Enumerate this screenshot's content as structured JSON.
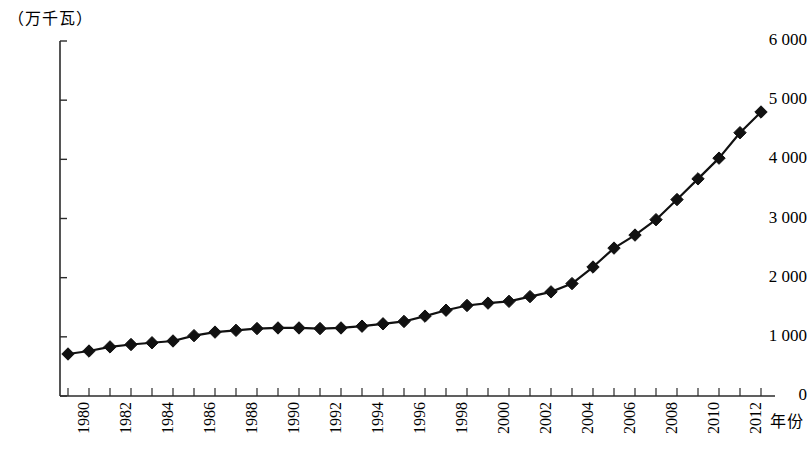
{
  "chart_data": {
    "type": "line",
    "title": "",
    "ylabel": "（万千瓦）",
    "xlabel": "年份",
    "ylim": [
      0,
      6000
    ],
    "ytick_labels": [
      "0",
      "1 000",
      "2 000",
      "3 000",
      "4 000",
      "5 000",
      "6 000"
    ],
    "ytick_values": [
      0,
      1000,
      2000,
      3000,
      4000,
      5000,
      6000
    ],
    "grid": false,
    "legend": "none",
    "marker": "diamond",
    "line_color": "#111111",
    "marker_color": "#111111",
    "x": [
      1980,
      1981,
      1982,
      1983,
      1984,
      1985,
      1986,
      1987,
      1988,
      1989,
      1990,
      1991,
      1992,
      1993,
      1994,
      1995,
      1996,
      1997,
      1998,
      1999,
      2000,
      2001,
      2002,
      2003,
      2004,
      2005,
      2006,
      2007,
      2008,
      2009,
      2010,
      2011,
      2012,
      2013
    ],
    "xtick_labels": [
      "1980",
      "1982",
      "1984",
      "1986",
      "1988",
      "1990",
      "1992",
      "1994",
      "1996",
      "1998",
      "2000",
      "2002",
      "2004",
      "2006",
      "2008",
      "2010",
      "2012"
    ],
    "values": [
      710,
      760,
      830,
      870,
      900,
      930,
      1020,
      1080,
      1110,
      1140,
      1150,
      1150,
      1140,
      1150,
      1180,
      1220,
      1260,
      1350,
      1450,
      1530,
      1570,
      1600,
      1680,
      1760,
      1900,
      2180,
      2500,
      2720,
      2980,
      3320,
      3670,
      4020,
      4450,
      4800
    ]
  }
}
